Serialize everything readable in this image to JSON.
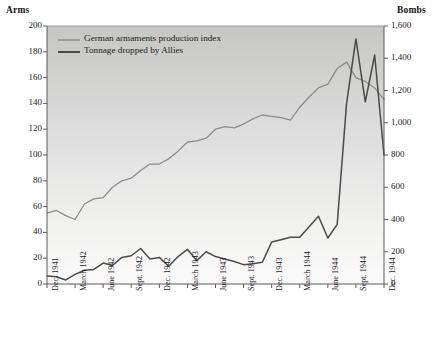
{
  "chart_data": {
    "type": "line",
    "title": "",
    "xlabel": "",
    "left_axis": {
      "label": "Arms",
      "ticks": [
        0,
        20,
        40,
        60,
        80,
        100,
        120,
        140,
        160,
        180,
        200
      ],
      "tick_labels": [
        "0",
        "20",
        "40",
        "60",
        "80",
        "100",
        "120",
        "140",
        "160",
        "180",
        "200"
      ],
      "ylim": [
        0,
        200
      ]
    },
    "right_axis": {
      "label": "Bombs",
      "ticks": [
        0,
        200,
        400,
        600,
        800,
        1000,
        1200,
        1400,
        1600
      ],
      "tick_labels": [
        "0",
        "200",
        "400",
        "600",
        "800",
        "1,000",
        "1,200",
        "1,400",
        "1,600"
      ],
      "ylim": [
        0,
        1600
      ]
    },
    "x_tick_labels": [
      "Dec. 1941",
      "March 1942",
      "June 1942",
      "Sept. 1942",
      "Dec. 1942",
      "March 1943",
      "June 1943",
      "Sept. 1943",
      "Dec. 1943",
      "March 1944",
      "June 1944",
      "Sept. 1944",
      "Dec. 1944"
    ],
    "x_months": [
      "Dec. 1941",
      "Jan. 1942",
      "Feb. 1942",
      "March 1942",
      "April 1942",
      "May 1942",
      "June 1942",
      "July 1942",
      "Aug. 1942",
      "Sept. 1942",
      "Oct. 1942",
      "Nov. 1942",
      "Dec. 1942",
      "Jan. 1943",
      "Feb. 1943",
      "March 1943",
      "April 1943",
      "May 1943",
      "June 1943",
      "July 1943",
      "Aug. 1943",
      "Sept. 1943",
      "Oct. 1943",
      "Nov. 1943",
      "Dec. 1943",
      "Jan. 1944",
      "Feb. 1944",
      "March 1944",
      "April 1944",
      "May 1944",
      "June 1944",
      "July 1944",
      "Aug. 1944",
      "Sept. 1944",
      "Oct. 1944",
      "Nov. 1944",
      "Dec. 1944"
    ],
    "grid": false,
    "legend_position": "top-left",
    "series": [
      {
        "name": "German armaments production index",
        "axis": "left",
        "color": "#8c8c8c",
        "width": 1.3,
        "values": [
          55,
          57,
          53,
          50,
          62,
          66,
          67,
          75,
          80,
          82,
          88,
          93,
          93,
          97,
          103,
          110,
          111,
          113,
          120,
          122,
          121,
          124,
          128,
          131,
          130,
          129,
          127,
          137,
          145,
          152,
          155,
          167,
          172,
          160,
          157,
          152,
          143
        ]
      },
      {
        "name": "Tonnage dropped by Allies",
        "axis": "right",
        "color": "#4a4a4a",
        "width": 1.5,
        "values": [
          50,
          45,
          25,
          60,
          85,
          90,
          130,
          115,
          165,
          175,
          220,
          155,
          165,
          110,
          170,
          215,
          145,
          200,
          170,
          155,
          140,
          120,
          125,
          135,
          260,
          275,
          290,
          290,
          355,
          420,
          285,
          370,
          1120,
          1520,
          1130,
          1420,
          800
        ]
      }
    ]
  },
  "legend": {
    "items": [
      {
        "label": "German armaments production index",
        "color": "#8c8c8c"
      },
      {
        "label": "Tonnage dropped by Allies",
        "color": "#4a4a4a"
      }
    ]
  }
}
